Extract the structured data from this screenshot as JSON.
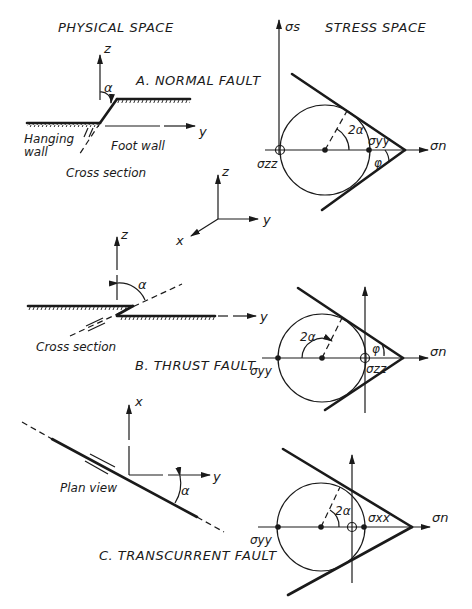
{
  "headers": {
    "physical_space": "PHYSICAL SPACE",
    "stress_space": "STRESS SPACE"
  },
  "reference_axes": {
    "z": "z",
    "y": "y",
    "x": "x"
  },
  "panel_a": {
    "title": "A. NORMAL FAULT",
    "physical": {
      "z_label": "z",
      "y_label": "y",
      "angle_label": "α",
      "hanging_wall_line1": "Hanging",
      "hanging_wall_line2": "wall",
      "foot_wall": "Foot wall",
      "view_caption": "Cross section"
    },
    "stress": {
      "vertical_axis_label": "σs",
      "horizontal_axis_label": "σn",
      "angle_2a": "2α",
      "phi": "φ",
      "sigma_left": "σzz",
      "sigma_right": "σyy"
    }
  },
  "panel_b": {
    "title": "B. THRUST FAULT",
    "physical": {
      "z_label": "z",
      "y_label": "y",
      "angle_label": "α",
      "view_caption": "Cross section"
    },
    "stress": {
      "horizontal_axis_label": "σn",
      "angle_2a": "2α",
      "phi": "φ",
      "sigma_left": "σyy",
      "sigma_right": "σzz"
    }
  },
  "panel_c": {
    "title": "C. TRANSCURRENT FAULT",
    "physical": {
      "x_label": "x",
      "y_label": "y",
      "angle_label": "α",
      "view_caption": "Plan view"
    },
    "stress": {
      "horizontal_axis_label": "σn",
      "angle_2a": "2α",
      "sigma_left": "σyy",
      "sigma_right": "σxx"
    }
  }
}
